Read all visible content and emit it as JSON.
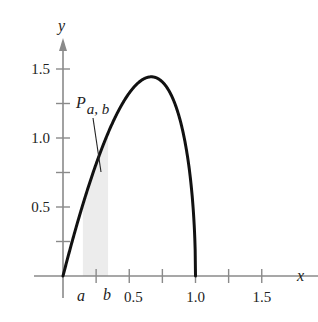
{
  "chart_data": {
    "type": "area",
    "title": "",
    "function": "y = (15/4) x sqrt(1 - x)",
    "xlabel": "x",
    "ylabel": "y",
    "xlim": [
      0,
      1.75
    ],
    "ylim": [
      0,
      1.75
    ],
    "x_ticks": [
      0.25,
      0.5,
      0.75,
      1.0,
      1.25,
      1.5
    ],
    "x_tick_labels": [
      {
        "value": 0.5,
        "label": "0.5"
      },
      {
        "value": 1.0,
        "label": "1.0"
      },
      {
        "value": 1.5,
        "label": "1.5"
      }
    ],
    "y_ticks": [
      0.25,
      0.5,
      0.75,
      1.0,
      1.25,
      1.5
    ],
    "y_tick_labels": [
      {
        "value": 0.5,
        "label": "0.5"
      },
      {
        "value": 1.0,
        "label": "1.0"
      },
      {
        "value": 1.5,
        "label": "1.5"
      }
    ],
    "series": [
      {
        "name": "curve",
        "x": [
          0,
          0.1,
          0.2,
          0.3,
          0.4,
          0.5,
          0.6,
          0.667,
          0.7,
          0.8,
          0.9,
          0.95,
          1.0
        ],
        "y": [
          0,
          0.356,
          0.671,
          0.941,
          1.162,
          1.326,
          1.423,
          1.443,
          1.438,
          1.342,
          1.067,
          0.796,
          0
        ]
      }
    ],
    "shaded_region": {
      "from_label": "a",
      "to_label": "b",
      "from": 0.15,
      "to": 0.34,
      "color": "#ececec"
    },
    "annotations": [
      {
        "text": "P",
        "subscript": "a, b",
        "points_to": "shaded region"
      },
      {
        "text": "a",
        "x": 0.15
      },
      {
        "text": "b",
        "x": 0.34
      }
    ],
    "grid": false,
    "legend": null
  }
}
